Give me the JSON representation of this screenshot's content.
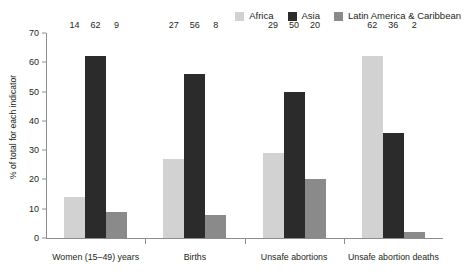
{
  "legend": {
    "position": "top-right",
    "items": [
      {
        "label": "Africa",
        "color": "#d2d2d2"
      },
      {
        "label": "Asia",
        "color": "#2b2b2b"
      },
      {
        "label": "Latin America & Caribbean",
        "color": "#8a8a8a"
      }
    ]
  },
  "axis": {
    "y_title": "% of total for each indicator",
    "y_ticks": [
      "0",
      "10",
      "20",
      "30",
      "40",
      "50",
      "60",
      "70"
    ]
  },
  "chart_data": {
    "type": "bar",
    "title": "",
    "xlabel": "",
    "ylabel": "% of total for each indicator",
    "ylim": [
      0,
      70
    ],
    "ytick_step": 10,
    "grid": false,
    "legend_position": "top-right",
    "categories": [
      "Women (15–49) years",
      "Births",
      "Unsafe abortions",
      "Unsafe abortion deaths"
    ],
    "series": [
      {
        "name": "Africa",
        "color": "#d2d2d2",
        "values": [
          14,
          27,
          29,
          62
        ]
      },
      {
        "name": "Asia",
        "color": "#2b2b2b",
        "values": [
          62,
          56,
          50,
          36
        ]
      },
      {
        "name": "Latin America & Caribbean",
        "color": "#8a8a8a",
        "values": [
          9,
          8,
          20,
          2
        ]
      }
    ]
  }
}
